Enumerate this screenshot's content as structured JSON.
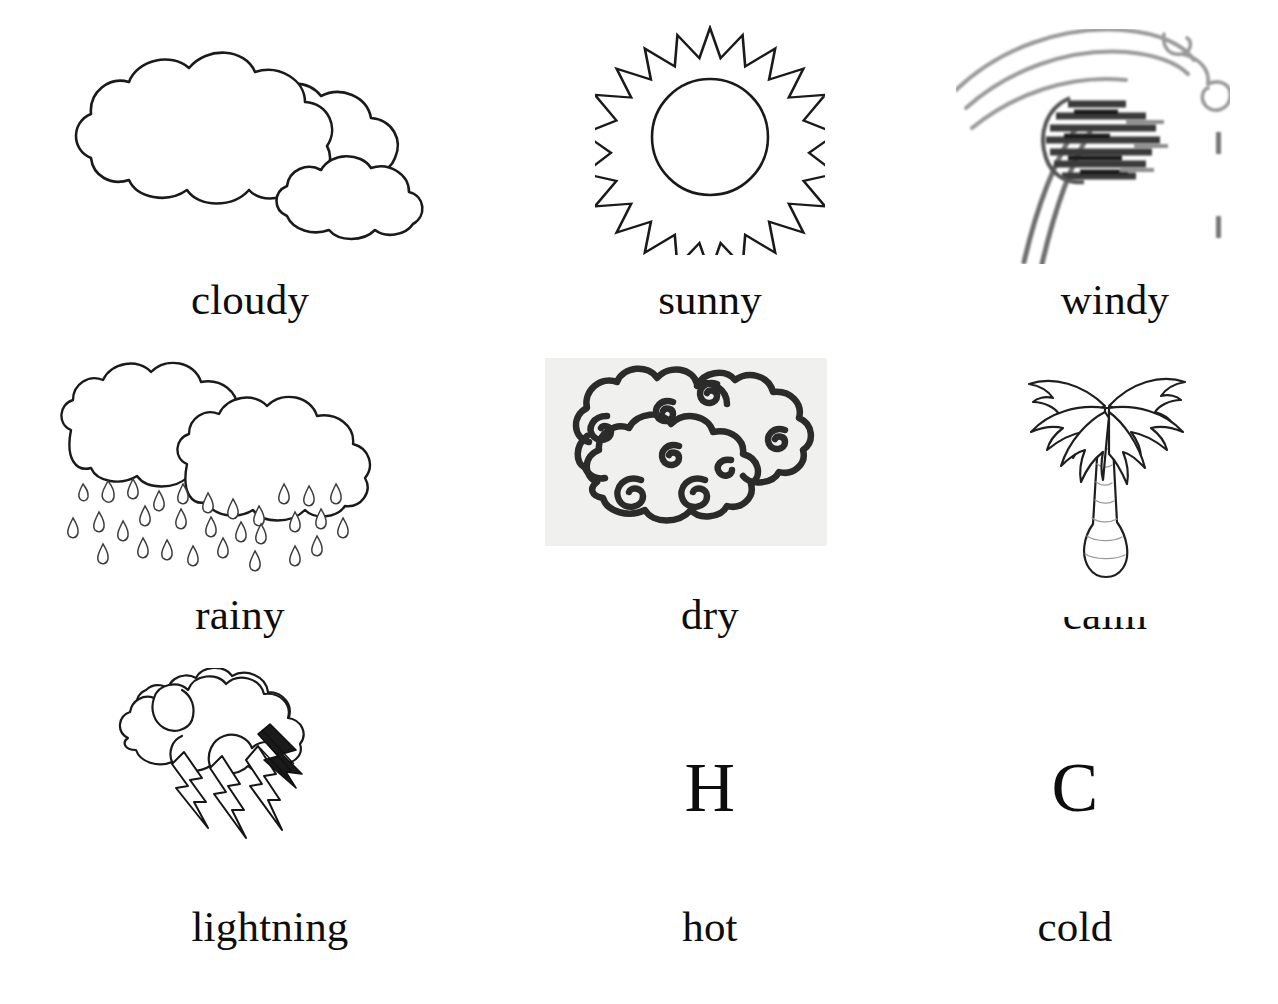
{
  "page": {
    "background_color": "#ffffff",
    "ink_color": "#0d0d0d",
    "dry_panel_color": "#f0f0ee",
    "columns": 3,
    "rows": 3
  },
  "items": [
    {
      "id": "cloudy",
      "label": "cloudy",
      "icon": "clouds-icon",
      "row": 1,
      "column": 1,
      "style": "line-drawing"
    },
    {
      "id": "sunny",
      "label": "sunny",
      "icon": "sun-icon",
      "row": 1,
      "column": 2,
      "style": "line-drawing"
    },
    {
      "id": "windy",
      "label": "windy",
      "icon": "wind-bending-tree-icon",
      "row": 1,
      "column": 3,
      "style": "low-resolution-raster"
    },
    {
      "id": "rainy",
      "label": "rainy",
      "icon": "rain-cloud-icon",
      "row": 2,
      "column": 1,
      "style": "line-drawing"
    },
    {
      "id": "dry",
      "label": "dry",
      "icon": "stylized-swirl-cloud-icon",
      "row": 2,
      "column": 2,
      "style": "bold-line-drawing-on-gray-panel"
    },
    {
      "id": "calm",
      "label": "calm",
      "icon": "palm-tree-icon",
      "row": 2,
      "column": 3,
      "style": "line-drawing",
      "note": "label partially obscured by palm trunk"
    },
    {
      "id": "lightning",
      "label": "lightning",
      "icon": "thunder-cloud-icon",
      "row": 3,
      "column": 1,
      "style": "line-drawing"
    },
    {
      "id": "hot",
      "label": "hot",
      "icon": "letter-h-glyph",
      "glyph": "H",
      "row": 3,
      "column": 2,
      "style": "typographic"
    },
    {
      "id": "cold",
      "label": "cold",
      "icon": "letter-c-glyph",
      "glyph": "C",
      "row": 3,
      "column": 3,
      "style": "typographic"
    }
  ]
}
